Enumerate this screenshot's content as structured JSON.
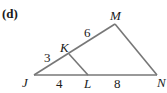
{
  "figure": {
    "label": "(d)",
    "points": {
      "J": {
        "name": "J",
        "x": 34,
        "y": 75
      },
      "K": {
        "name": "K",
        "x": 69,
        "y": 54
      },
      "M": {
        "name": "M",
        "x": 115,
        "y": 24
      },
      "L": {
        "name": "L",
        "x": 88,
        "y": 75
      },
      "N": {
        "name": "N",
        "x": 157,
        "y": 75
      }
    },
    "segments": {
      "JK": "3",
      "KM": "6",
      "JL": "4",
      "LN": "8"
    },
    "stroke_color": "#777777"
  }
}
